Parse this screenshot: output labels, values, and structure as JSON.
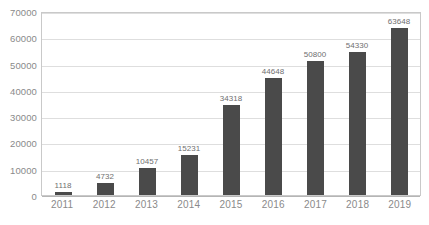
{
  "chart_data": {
    "type": "bar",
    "title": "",
    "subtitle": "",
    "xlabel": "",
    "ylabel": "",
    "categories": [
      "2011",
      "2012",
      "2013",
      "2014",
      "2015",
      "2016",
      "2017",
      "2018",
      "2019"
    ],
    "values": [
      1118,
      4732,
      10457,
      15231,
      34318,
      44648,
      50800,
      54330,
      63648
    ],
    "data_labels": [
      "1118",
      "4732",
      "10457",
      "15231",
      "34318",
      "44648",
      "50800",
      "54330",
      "63648"
    ],
    "ylim": [
      0,
      70000
    ],
    "y_ticks": [
      70000,
      60000,
      50000,
      40000,
      30000,
      20000,
      10000,
      0
    ],
    "y_tick_labels": [
      "70000",
      "60000",
      "50000",
      "40000",
      "30000",
      "20000",
      "10000",
      "0"
    ],
    "grid": true,
    "grid_axis": "y",
    "legend": false,
    "legend_position": "none",
    "series": [
      {
        "name": "",
        "values": [
          1118,
          4732,
          10457,
          15231,
          34318,
          44648,
          50800,
          54330,
          63648
        ],
        "color": "#4a4a4a"
      }
    ],
    "colors": {
      "bar": "#4a4a4a",
      "gridline": "#dedede",
      "axis_border": "#c9c9c9",
      "tick_text": "#8a8a8a",
      "label_text": "#6f6f6f",
      "background": "#ffffff"
    }
  }
}
